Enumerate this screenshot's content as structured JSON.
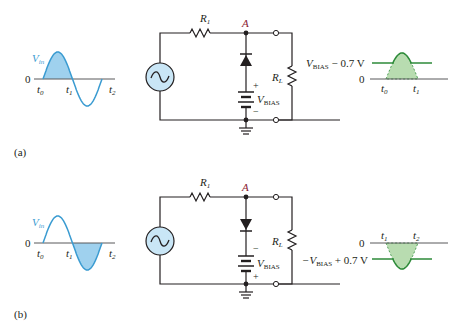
{
  "colors": {
    "input_wave": "#3a9bd1",
    "input_fill": "#9fd1ee",
    "output_wave": "#2e8b3a",
    "output_fill": "#b8dcb0",
    "source_fill": "#c9e6f6",
    "node_label": "#8b2232",
    "wire": "#231f20"
  },
  "panels": [
    {
      "label": "(a)",
      "input": {
        "signal_label": "V",
        "signal_sub": "in",
        "zero": "0",
        "t0": "t",
        "t0_sub": "0",
        "t1": "t",
        "t1_sub": "1",
        "t2": "t",
        "t2_sub": "2",
        "shaded_half": "positive"
      },
      "circuit": {
        "r1": "R",
        "r1_sub": "1",
        "node": "A",
        "rl": "R",
        "rl_sub": "L",
        "vbias": "V",
        "vbias_sub": "BIAS",
        "top_terminal": "+",
        "bottom_terminal": "−",
        "diode_orientation": "anode-down"
      },
      "output": {
        "level_label_pre": "V",
        "level_label_sub": "BIAS",
        "level_label_post": " − 0.7 V",
        "zero": "0",
        "ta": "t",
        "ta_sub": "0",
        "tb": "t",
        "tb_sub": "1",
        "polarity": "positive"
      }
    },
    {
      "label": "(b)",
      "input": {
        "signal_label": "V",
        "signal_sub": "in",
        "zero": "0",
        "t0": "t",
        "t0_sub": "0",
        "t1": "t",
        "t1_sub": "1",
        "t2": "t",
        "t2_sub": "2",
        "shaded_half": "negative"
      },
      "circuit": {
        "r1": "R",
        "r1_sub": "1",
        "node": "A",
        "rl": "R",
        "rl_sub": "L",
        "vbias": "V",
        "vbias_sub": "BIAS",
        "top_terminal": "−",
        "bottom_terminal": "+",
        "diode_orientation": "anode-up"
      },
      "output": {
        "level_label_pre": "−V",
        "level_label_sub": "BIAS",
        "level_label_post": " + 0.7 V",
        "zero": "0",
        "ta": "t",
        "ta_sub": "1",
        "tb": "t",
        "tb_sub": "2",
        "polarity": "negative"
      }
    }
  ]
}
